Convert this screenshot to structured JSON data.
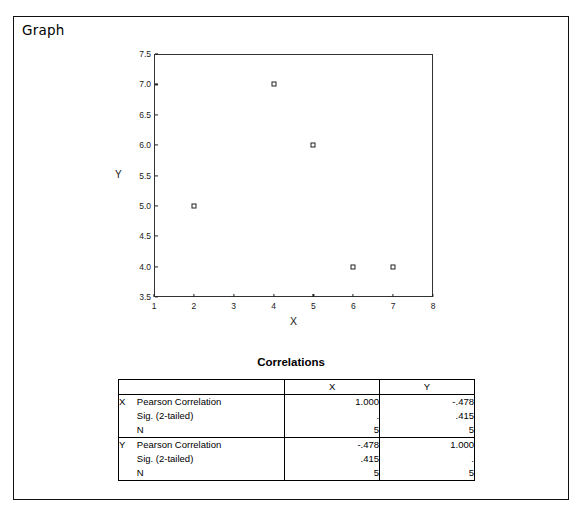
{
  "output": {
    "graph_label": "Graph"
  },
  "chart_data": {
    "type": "scatter",
    "title": "",
    "xlabel": "X",
    "ylabel": "Y",
    "xlim": [
      1,
      8
    ],
    "ylim": [
      3.5,
      7.5
    ],
    "xticks": [
      "1",
      "2",
      "3",
      "4",
      "5",
      "6",
      "7",
      "8"
    ],
    "yticks": [
      "3.5",
      "4.0",
      "4.5",
      "5.0",
      "5.5",
      "6.0",
      "6.5",
      "7.0",
      "7.5"
    ],
    "grid": false,
    "legend": null,
    "marker": "open-square",
    "x": [
      2,
      4,
      5,
      6,
      7
    ],
    "y": [
      5,
      7,
      6,
      4,
      4
    ],
    "points": [
      {
        "x": 2,
        "y": 5
      },
      {
        "x": 4,
        "y": 7
      },
      {
        "x": 5,
        "y": 6
      },
      {
        "x": 6,
        "y": 4
      },
      {
        "x": 7,
        "y": 4
      }
    ]
  },
  "correlations": {
    "title": "Correlations",
    "corner_label": "",
    "column_headers": [
      "X",
      "Y"
    ],
    "groups": [
      {
        "variable": "X",
        "rows": [
          {
            "statistic": "Pearson Correlation",
            "x": "1.000",
            "y": "-.478"
          },
          {
            "statistic": "Sig. (2-tailed)",
            "x": ".",
            "y": ".415"
          },
          {
            "statistic": "N",
            "x": "5",
            "y": "5"
          }
        ]
      },
      {
        "variable": "Y",
        "rows": [
          {
            "statistic": "Pearson Correlation",
            "x": "-.478",
            "y": "1.000"
          },
          {
            "statistic": "Sig. (2-tailed)",
            "x": ".415",
            "y": "."
          },
          {
            "statistic": "N",
            "x": "5",
            "y": "5"
          }
        ]
      }
    ]
  }
}
